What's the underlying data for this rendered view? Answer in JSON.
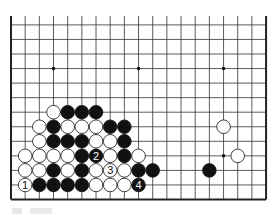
{
  "diagram": {
    "type": "go-board-diagram",
    "board_size": 19,
    "visible_region": "lower half (rows 1-13 from bottom edge), all 19 columns, top side open",
    "colors": {
      "line": "#333333",
      "edge": "#222222",
      "black_stone": "#111111",
      "white_stone": "#ffffff",
      "background": "#ffffff"
    },
    "star_points": [
      {
        "col": 3,
        "row": 10
      },
      {
        "col": 9,
        "row": 10
      },
      {
        "col": 15,
        "row": 10
      },
      {
        "col": 15,
        "row": 4
      }
    ],
    "stones": [
      {
        "color": "white",
        "col": 3,
        "row": 7
      },
      {
        "color": "black",
        "col": 4,
        "row": 7
      },
      {
        "color": "black",
        "col": 5,
        "row": 7
      },
      {
        "color": "black",
        "col": 6,
        "row": 7
      },
      {
        "color": "white",
        "col": 2,
        "row": 6
      },
      {
        "color": "black",
        "col": 3,
        "row": 6
      },
      {
        "color": "white",
        "col": 4,
        "row": 6
      },
      {
        "color": "white",
        "col": 5,
        "row": 6
      },
      {
        "color": "white",
        "col": 6,
        "row": 6
      },
      {
        "color": "black",
        "col": 7,
        "row": 6
      },
      {
        "color": "black",
        "col": 8,
        "row": 6
      },
      {
        "color": "white",
        "col": 15,
        "row": 6
      },
      {
        "color": "white",
        "col": 2,
        "row": 5
      },
      {
        "color": "black",
        "col": 3,
        "row": 5
      },
      {
        "color": "black",
        "col": 4,
        "row": 5
      },
      {
        "color": "black",
        "col": 5,
        "row": 5
      },
      {
        "color": "white",
        "col": 6,
        "row": 5
      },
      {
        "color": "white",
        "col": 7,
        "row": 5
      },
      {
        "color": "black",
        "col": 8,
        "row": 5
      },
      {
        "color": "white",
        "col": 1,
        "row": 4
      },
      {
        "color": "white",
        "col": 2,
        "row": 4
      },
      {
        "color": "white",
        "col": 3,
        "row": 4
      },
      {
        "color": "white",
        "col": 4,
        "row": 4
      },
      {
        "color": "black",
        "col": 5,
        "row": 4
      },
      {
        "color": "black",
        "col": 6,
        "row": 4,
        "label": "2"
      },
      {
        "color": "white",
        "col": 7,
        "row": 4
      },
      {
        "color": "black",
        "col": 8,
        "row": 4
      },
      {
        "color": "white",
        "col": 9,
        "row": 4
      },
      {
        "color": "white",
        "col": 16,
        "row": 4
      },
      {
        "color": "white",
        "col": 1,
        "row": 3
      },
      {
        "color": "white",
        "col": 2,
        "row": 3
      },
      {
        "color": "black",
        "col": 3,
        "row": 3
      },
      {
        "color": "white",
        "col": 4,
        "row": 3
      },
      {
        "color": "black",
        "col": 5,
        "row": 3
      },
      {
        "color": "white",
        "col": 6,
        "row": 3
      },
      {
        "color": "white",
        "col": 7,
        "row": 3,
        "label": "3"
      },
      {
        "color": "white",
        "col": 8,
        "row": 3
      },
      {
        "color": "black",
        "col": 9,
        "row": 3
      },
      {
        "color": "black",
        "col": 10,
        "row": 3
      },
      {
        "color": "black",
        "col": 14,
        "row": 3
      },
      {
        "color": "white",
        "col": 1,
        "row": 2,
        "label": "1"
      },
      {
        "color": "black",
        "col": 2,
        "row": 2
      },
      {
        "color": "black",
        "col": 3,
        "row": 2
      },
      {
        "color": "black",
        "col": 4,
        "row": 2
      },
      {
        "color": "black",
        "col": 5,
        "row": 2
      },
      {
        "color": "white",
        "col": 6,
        "row": 2
      },
      {
        "color": "white",
        "col": 7,
        "row": 2
      },
      {
        "color": "white",
        "col": 8,
        "row": 2
      },
      {
        "color": "black",
        "col": 9,
        "row": 2,
        "label": "4"
      }
    ],
    "move_labels": [
      "1",
      "2",
      "3",
      "4"
    ]
  }
}
